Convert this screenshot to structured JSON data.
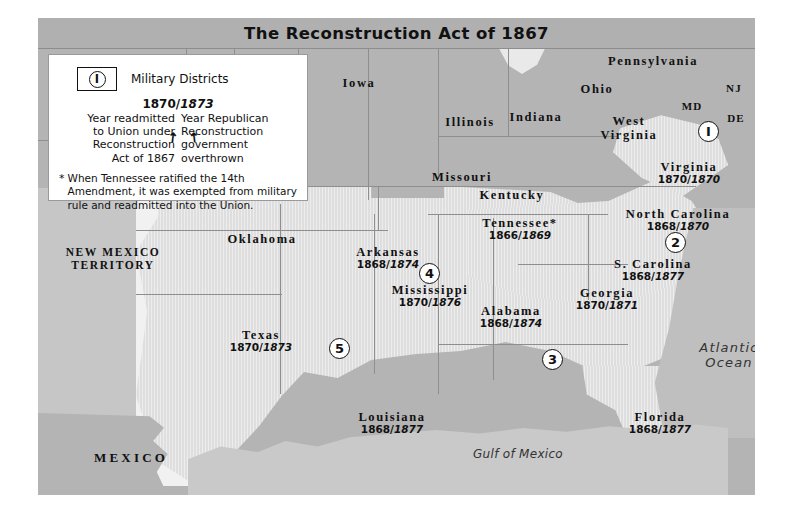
{
  "title": "The Reconstruction Act of 1867",
  "legend": {
    "district_symbol": "I",
    "district_caption": "Military Districts",
    "sample_years": "1870/1873",
    "sample_year_left": "1870",
    "sample_year_sep": "/",
    "sample_year_right": "1873",
    "left_note": "Year readmitted\nto Union under\nReconstruction\nAct of 1867",
    "left_note_l1": "Year readmitted",
    "left_note_l2": "to Union under",
    "left_note_l3": "Reconstruction",
    "left_note_l4": "Act of 1867",
    "right_note_l1": "Year Republican",
    "right_note_l2": "Reconstruction",
    "right_note_l3": "government",
    "right_note_l4": "overthrown",
    "arrow_left_glyph": "↗",
    "arrow_right_glyph": "↗",
    "footnote_star": "*",
    "footnote": "When Tennessee ratified the 14th Amendment, it was exempted from military rule and readmitted into the Union."
  },
  "oceans": [
    {
      "name": "atlantic-ocean",
      "line1": "Atlantic",
      "line2": "Ocean"
    },
    {
      "name": "gulf-of-mexico",
      "line1": "Gulf of Mexico",
      "line2": ""
    }
  ],
  "regions": [
    {
      "name": "new-mexico-territory",
      "line1": "NEW MEXICO",
      "line2": "TERRITORY"
    },
    {
      "name": "mexico",
      "line1": "MEXICO",
      "line2": ""
    }
  ],
  "union_states": [
    {
      "name": "iowa",
      "label": "Iowa"
    },
    {
      "name": "illinois",
      "label": "Illinois"
    },
    {
      "name": "indiana",
      "label": "Indiana"
    },
    {
      "name": "ohio",
      "label": "Ohio"
    },
    {
      "name": "pennsylvania",
      "label": "Pennsylvania"
    },
    {
      "name": "new-jersey",
      "label": "NJ"
    },
    {
      "name": "maryland",
      "label": "MD"
    },
    {
      "name": "delaware",
      "label": "DE"
    },
    {
      "name": "west-virginia",
      "label1": "West",
      "label2": "Virginia"
    },
    {
      "name": "missouri",
      "label": "Missouri"
    },
    {
      "name": "kentucky",
      "label": "Kentucky"
    },
    {
      "name": "oklahoma",
      "label": "Oklahoma"
    }
  ],
  "reconstruction_states": [
    {
      "name": "virginia",
      "label": "Virginia",
      "readmitted": "1870",
      "overthrown": "1870"
    },
    {
      "name": "north-carolina",
      "label": "North Carolina",
      "readmitted": "1868",
      "overthrown": "1870"
    },
    {
      "name": "south-carolina",
      "label": "S. Carolina",
      "readmitted": "1868",
      "overthrown": "1877"
    },
    {
      "name": "tennessee",
      "label": "Tennessee*",
      "readmitted": "1866",
      "overthrown": "1869"
    },
    {
      "name": "georgia",
      "label": "Georgia",
      "readmitted": "1870",
      "overthrown": "1871"
    },
    {
      "name": "alabama",
      "label": "Alabama",
      "readmitted": "1868",
      "overthrown": "1874"
    },
    {
      "name": "mississippi",
      "label": "Mississippi",
      "readmitted": "1870",
      "overthrown": "1876"
    },
    {
      "name": "arkansas",
      "label": "Arkansas",
      "readmitted": "1868",
      "overthrown": "1874"
    },
    {
      "name": "louisiana",
      "label": "Louisiana",
      "readmitted": "1868",
      "overthrown": "1877"
    },
    {
      "name": "florida",
      "label": "Florida",
      "readmitted": "1868",
      "overthrown": "1877"
    },
    {
      "name": "texas",
      "label": "Texas",
      "readmitted": "1870",
      "overthrown": "1873"
    }
  ],
  "military_districts": [
    {
      "name": "district-1",
      "number": "1",
      "glyph": "I"
    },
    {
      "name": "district-2",
      "number": "2",
      "glyph": "2"
    },
    {
      "name": "district-3",
      "number": "3",
      "glyph": "3"
    },
    {
      "name": "district-4",
      "number": "4",
      "glyph": "4"
    },
    {
      "name": "district-5",
      "number": "5",
      "glyph": "5"
    }
  ],
  "colors": {
    "title_bar": "#b0b0b0",
    "union_land": "#b4b4b4",
    "reconstruction_land": "#dedede",
    "ocean": "#bfbfbf",
    "legend_bg": "#ffffff",
    "text": "#111111"
  }
}
